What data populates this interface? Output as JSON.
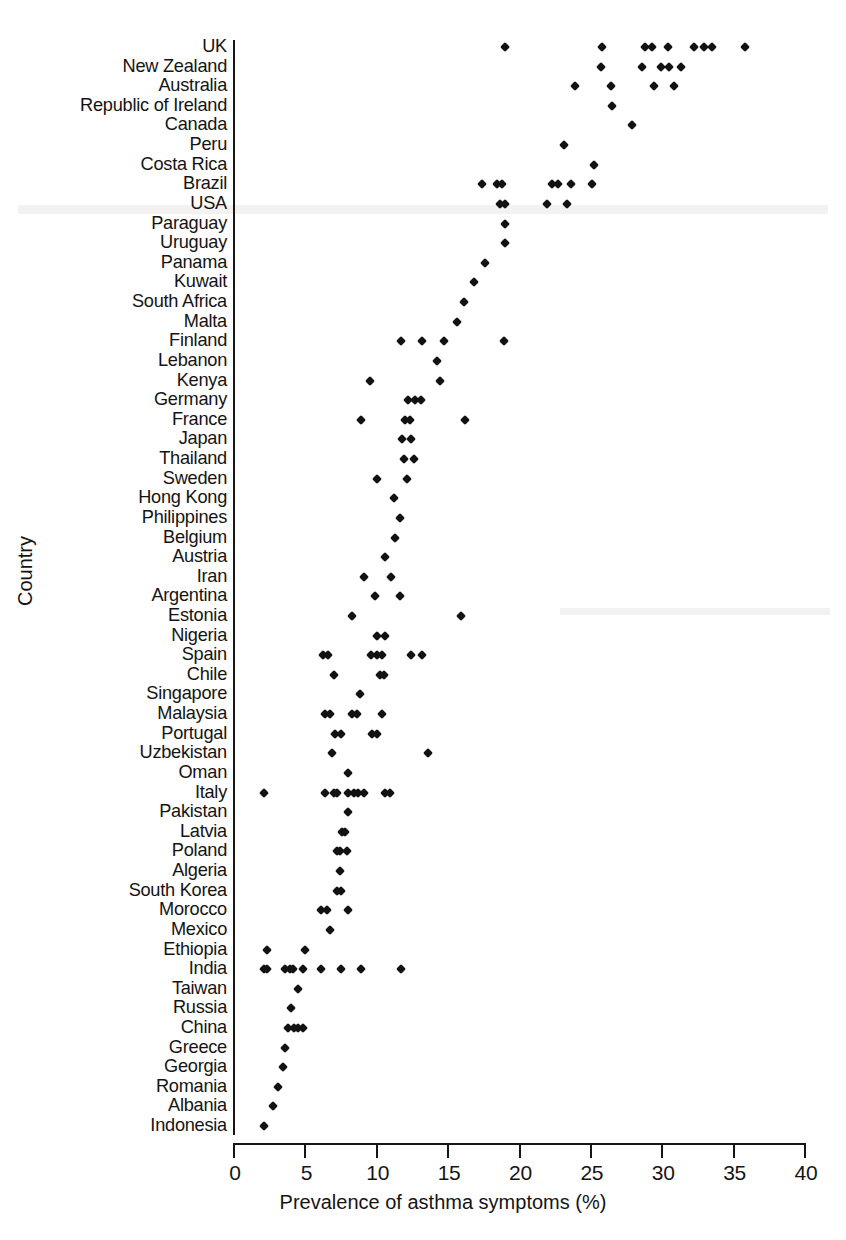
{
  "chart_data": {
    "type": "scatter",
    "title": "",
    "xlabel": "Prevalence of asthma symptoms (%)",
    "ylabel": "Country",
    "xlim": [
      0,
      40
    ],
    "xticks": [
      0,
      5,
      10,
      15,
      20,
      25,
      30,
      35,
      40
    ],
    "grid": false,
    "legend": null,
    "marker": "diamond",
    "marker_color": "#121212",
    "axis_color": "#161616",
    "background_color": "#ffffff",
    "categories": [
      "UK",
      "New Zealand",
      "Australia",
      "Republic of Ireland",
      "Canada",
      "Peru",
      "Costa Rica",
      "Brazil",
      "USA",
      "Paraguay",
      "Uruguay",
      "Panama",
      "Kuwait",
      "South Africa",
      "Malta",
      "Finland",
      "Lebanon",
      "Kenya",
      "Germany",
      "France",
      "Japan",
      "Thailand",
      "Sweden",
      "Hong Kong",
      "Philippines",
      "Belgium",
      "Austria",
      "Iran",
      "Argentina",
      "Estonia",
      "Nigeria",
      "Spain",
      "Chile",
      "Singapore",
      "Malaysia",
      "Portugal",
      "Uzbekistan",
      "Oman",
      "Italy",
      "Pakistan",
      "Latvia",
      "Poland",
      "Algeria",
      "South Korea",
      "Morocco",
      "Mexico",
      "Ethiopia",
      "India",
      "Taiwan",
      "Russia",
      "China",
      "Greece",
      "Georgia",
      "Romania",
      "Albania",
      "Indonesia"
    ],
    "series": [
      {
        "name": "Prevalence of asthma symptoms (%)",
        "points_by_country": {
          "UK": [
            19.0,
            25.8,
            28.8,
            29.3,
            30.4,
            32.2,
            32.9,
            33.5,
            35.8
          ],
          "New Zealand": [
            25.7,
            28.6,
            29.9,
            30.5,
            31.3
          ],
          "Australia": [
            23.9,
            26.4,
            29.4,
            30.8
          ],
          "Republic of Ireland": [
            26.5
          ],
          "Canada": [
            27.9
          ],
          "Peru": [
            23.1
          ],
          "Costa Rica": [
            25.2
          ],
          "Brazil": [
            17.4,
            18.4,
            18.8,
            22.3,
            22.7,
            23.6,
            25.1
          ],
          "USA": [
            18.6,
            19.0,
            21.9,
            23.3
          ],
          "Paraguay": [
            19.0
          ],
          "Uruguay": [
            19.0
          ],
          "Panama": [
            17.6
          ],
          "Kuwait": [
            16.8
          ],
          "South Africa": [
            16.1
          ],
          "Malta": [
            15.6
          ],
          "Finland": [
            11.7,
            13.2,
            14.7,
            18.9
          ],
          "Lebanon": [
            14.2
          ],
          "Kenya": [
            9.5,
            14.4
          ],
          "Germany": [
            12.2,
            12.7,
            13.1
          ],
          "France": [
            8.9,
            12.0,
            12.3,
            16.2
          ],
          "Japan": [
            11.8,
            12.4
          ],
          "Thailand": [
            11.9,
            12.6
          ],
          "Sweden": [
            10.0,
            12.1
          ],
          "Hong Kong": [
            11.2
          ],
          "Philippines": [
            11.6
          ],
          "Belgium": [
            11.3
          ],
          "Austria": [
            10.6
          ],
          "Iran": [
            9.1,
            11.0
          ],
          "Argentina": [
            9.9,
            11.6
          ],
          "Estonia": [
            8.3,
            15.9
          ],
          "Nigeria": [
            10.0,
            10.6
          ],
          "Spain": [
            6.2,
            6.6,
            9.6,
            10.0,
            10.4,
            12.4,
            13.2
          ],
          "Chile": [
            7.0,
            10.2,
            10.5
          ],
          "Singapore": [
            8.8
          ],
          "Malaysia": [
            6.4,
            6.7,
            8.3,
            8.6,
            10.4
          ],
          "Portugal": [
            7.1,
            7.5,
            9.7,
            10.0
          ],
          "Uzbekistan": [
            6.9,
            13.6
          ],
          "Oman": [
            8.0
          ],
          "Italy": [
            2.1,
            6.4,
            7.0,
            7.2,
            8.0,
            8.4,
            8.7,
            9.1,
            10.6,
            10.9
          ],
          "Pakistan": [
            8.0
          ],
          "Latvia": [
            7.6,
            7.8
          ],
          "Poland": [
            7.2,
            7.4,
            7.9
          ],
          "Algeria": [
            7.4
          ],
          "South Korea": [
            7.2,
            7.5
          ],
          "Morocco": [
            6.1,
            6.5,
            8.0
          ],
          "Mexico": [
            6.7
          ],
          "Ethiopia": [
            2.3,
            5.0
          ],
          "India": [
            2.1,
            2.3,
            3.6,
            3.9,
            4.1,
            4.8,
            6.1,
            7.5,
            8.9,
            11.7
          ],
          "Taiwan": [
            4.5
          ],
          "Russia": [
            4.0
          ],
          "China": [
            3.8,
            4.2,
            4.5,
            4.8
          ],
          "Greece": [
            3.6
          ],
          "Georgia": [
            3.4
          ],
          "Romania": [
            3.1
          ],
          "Albania": [
            2.7
          ],
          "Indonesia": [
            2.1
          ]
        }
      }
    ]
  },
  "axes": {
    "x_title": "Prevalence of asthma symptoms (%)",
    "y_title": "Country",
    "x_tick_labels": [
      "0",
      "5",
      "10",
      "15",
      "20",
      "25",
      "30",
      "35",
      "40"
    ]
  }
}
